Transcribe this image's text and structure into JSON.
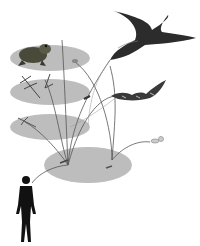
{
  "diagram": {
    "colors": {
      "ellipse": "#bdbdbd",
      "line": "#555555",
      "figure": "#111111",
      "background": "#ffffff"
    },
    "layers": [
      {
        "name": "frog-layer",
        "cx": 50,
        "cy": 58,
        "rx": 40,
        "ry": 13
      },
      {
        "name": "dragonfly-layer",
        "cx": 50,
        "cy": 92,
        "rx": 40,
        "ry": 13
      },
      {
        "name": "aquatic-insect-layer",
        "cx": 50,
        "cy": 127,
        "rx": 40,
        "ry": 13
      },
      {
        "name": "ground-layer",
        "cx": 88,
        "cy": 165,
        "rx": 44,
        "ry": 18
      }
    ],
    "organisms": [
      "frog",
      "swallow",
      "bat",
      "dragonfly",
      "small-insect",
      "mosquito",
      "human"
    ]
  }
}
